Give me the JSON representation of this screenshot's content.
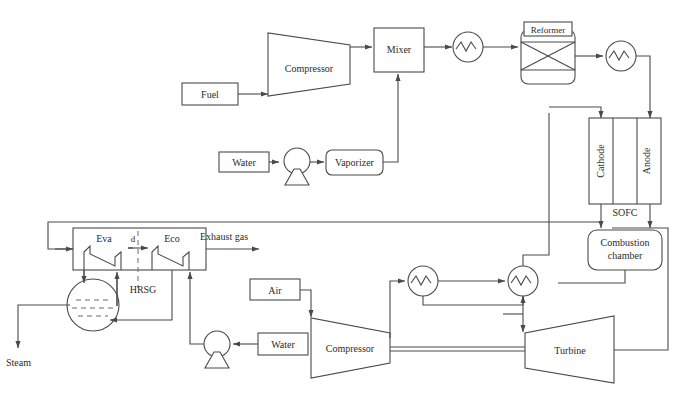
{
  "figure": {
    "type": "process-flow-diagram",
    "caption": ""
  },
  "nodes": {
    "fuel": "Fuel",
    "fuel_compressor": "Compressor",
    "mixer": "Mixer",
    "reformer": "Reformer",
    "water_top": "Water",
    "vaporizer": "Vaporizer",
    "cathode": "Cathode",
    "anode": "Anode",
    "sofc": "SOFC",
    "combustion_chamber_line1": "Combustion",
    "combustion_chamber_line2": "chamber",
    "eva": "Eva",
    "eco": "Eco",
    "hrsg": "HRSG",
    "pinch": "d",
    "exhaust_gas": "Exhaust gas",
    "steam": "Steam",
    "air": "Air",
    "water_bottom": "Water",
    "air_compressor": "Compressor",
    "turbine": "Turbine"
  },
  "icons": {
    "heat_exchanger": "heat-exchanger-icon",
    "pump": "pump-icon",
    "drum": "steam-drum-icon",
    "compressor": "compressor-icon",
    "turbine": "turbine-icon",
    "reformer": "reformer-icon"
  },
  "colors": {
    "line": "#4a4a4a",
    "text": "#2b2b2b",
    "fill": "#ffffff",
    "background": "#ffffff"
  },
  "counts": {
    "heat_exchangers": 4,
    "pumps": 2,
    "compressors": 2,
    "turbines": 1
  }
}
